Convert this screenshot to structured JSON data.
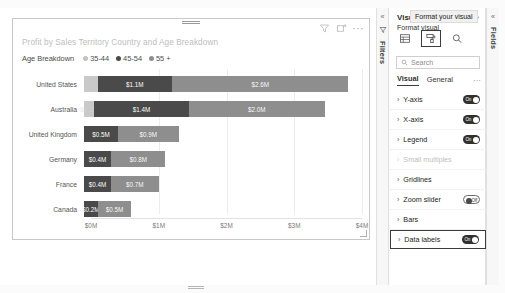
{
  "visual": {
    "title": "Profit by Sales Territory Country and Age Breakdown",
    "header_icons": {
      "filter": "filter-icon",
      "focus": "focus-mode-icon",
      "more": "···"
    },
    "legend": {
      "title": "Age Breakdown",
      "items": [
        {
          "label": "35-44",
          "color": "#c9c9c9"
        },
        {
          "label": "45-54",
          "color": "#4a4a4a"
        },
        {
          "label": "55 +",
          "color": "#8e8e8e"
        }
      ]
    }
  },
  "chart_data": {
    "type": "bar",
    "orientation": "horizontal",
    "stacked": true,
    "title": "Profit by Sales Territory Country and Age Breakdown",
    "xlabel": "",
    "ylabel": "",
    "xlim": [
      0,
      4000000
    ],
    "xticks": [
      "$0M",
      "$1M",
      "$2M",
      "$3M",
      "$4M"
    ],
    "xtick_values": [
      0,
      1000000,
      2000000,
      3000000,
      4000000
    ],
    "grid": true,
    "legend_position": "top",
    "categories": [
      "United States",
      "Australia",
      "United Kingdom",
      "Germany",
      "France",
      "Canada"
    ],
    "series": [
      {
        "name": "35-44",
        "color": "#c9c9c9",
        "values": [
          200000,
          150000,
          0,
          0,
          0,
          0
        ],
        "labels": [
          "",
          "$0.1M",
          "",
          "",
          "",
          ""
        ]
      },
      {
        "name": "45-54",
        "color": "#4a4a4a",
        "values": [
          1100000,
          1400000,
          500000,
          400000,
          400000,
          200000
        ],
        "labels": [
          "$1.1M",
          "$1.4M",
          "$0.5M",
          "$0.4M",
          "$0.4M",
          "$0.2M"
        ]
      },
      {
        "name": "55 +",
        "color": "#8e8e8e",
        "values": [
          2600000,
          2000000,
          900000,
          800000,
          700000,
          500000
        ],
        "labels": [
          "$2.6M",
          "$2.0M",
          "$0.9M",
          "$0.8M",
          "$0.7M",
          "$0.5M"
        ]
      }
    ]
  },
  "filters_rail": {
    "collapse": "«",
    "funnel": "filter-icon",
    "label": "Filters"
  },
  "fields_rail": {
    "collapse": "«",
    "label": "Fields"
  },
  "format_pane": {
    "pane_title": "Visu",
    "section_title": "Format visual",
    "collapse_icon": "»",
    "tooltip": "Format your visual",
    "tabs": [
      {
        "name": "build-visual-tab",
        "icon": "table-icon",
        "selected": false
      },
      {
        "name": "format-visual-tab",
        "icon": "paint-roller-icon",
        "selected": true
      },
      {
        "name": "analytics-tab",
        "icon": "magnifier-icon",
        "selected": false
      }
    ],
    "search_placeholder": "Search",
    "search_value": "",
    "subtabs": [
      {
        "label": "Visual",
        "active": true
      },
      {
        "label": "General",
        "active": false
      }
    ],
    "more_options": "···",
    "items": [
      {
        "label": "Y-axis",
        "toggle": "on",
        "toggle_text": "On",
        "disabled": false,
        "highlighted": false
      },
      {
        "label": "X-axis",
        "toggle": "on",
        "toggle_text": "On",
        "disabled": false,
        "highlighted": false
      },
      {
        "label": "Legend",
        "toggle": "on",
        "toggle_text": "On",
        "disabled": false,
        "highlighted": false
      },
      {
        "label": "Small multiples",
        "toggle": "none",
        "toggle_text": "",
        "disabled": true,
        "highlighted": false
      },
      {
        "label": "Gridlines",
        "toggle": "none",
        "toggle_text": "",
        "disabled": false,
        "highlighted": false
      },
      {
        "label": "Zoom slider",
        "toggle": "off",
        "toggle_text": "Off",
        "disabled": false,
        "highlighted": false
      },
      {
        "label": "Bars",
        "toggle": "none",
        "toggle_text": "",
        "disabled": false,
        "highlighted": false
      },
      {
        "label": "Data labels",
        "toggle": "on",
        "toggle_text": "On",
        "disabled": false,
        "highlighted": true
      }
    ]
  }
}
